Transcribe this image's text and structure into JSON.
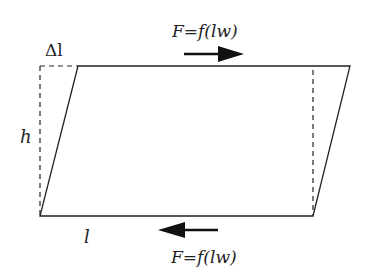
{
  "diagram": {
    "labels": {
      "delta_l": "Δl",
      "height": "h",
      "length": "l",
      "force_top": "F=f(lw)",
      "force_bottom": "F=f(lw)"
    },
    "forces": [
      {
        "name": "top-force",
        "direction": "right",
        "label": "F=f(lw)"
      },
      {
        "name": "bottom-force",
        "direction": "left",
        "label": "F=f(lw)"
      }
    ],
    "colors": {
      "line": "#222222",
      "background": "#ffffff"
    }
  }
}
